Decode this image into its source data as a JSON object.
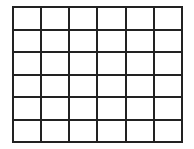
{
  "grid": {
    "rows": 6,
    "columns": 6,
    "line_color": "#222222",
    "background_color": "#ffffff",
    "cells": [
      [
        "",
        "",
        "",
        "",
        "",
        ""
      ],
      [
        "",
        "",
        "",
        "",
        "",
        ""
      ],
      [
        "",
        "",
        "",
        "",
        "",
        ""
      ],
      [
        "",
        "",
        "",
        "",
        "",
        ""
      ],
      [
        "",
        "",
        "",
        "",
        "",
        ""
      ],
      [
        "",
        "",
        "",
        "",
        "",
        ""
      ]
    ]
  }
}
